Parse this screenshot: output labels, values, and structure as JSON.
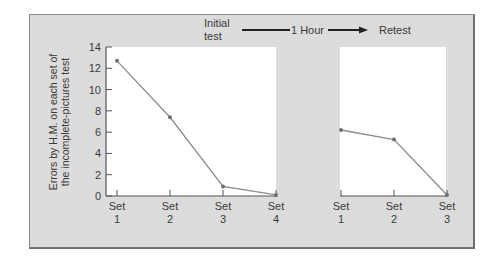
{
  "header": {
    "initial_line1": "Initial",
    "initial_line2": "test",
    "interval": "1 Hour",
    "retest": "Retest"
  },
  "y_axis_label_line1": "Errors by H.M. on each set of",
  "y_axis_label_line2": "the incomplete-pictures test",
  "colors": {
    "panel": "#dcdcdc",
    "plot_bg": "#ffffff",
    "line": "#8c8c8c",
    "marker": "#6e6e6e",
    "axis": "#555555",
    "text": "#3a3a3a"
  },
  "chart_data": [
    {
      "type": "line",
      "title": "Initial test",
      "categories": [
        "Set 1",
        "Set 2",
        "Set 3",
        "Set 4"
      ],
      "series": [
        {
          "name": "Errors by H.M.",
          "values": [
            12.7,
            7.4,
            0.9,
            0.1
          ]
        }
      ],
      "xlabel": "",
      "ylabel": "Errors by H.M. on each set of the incomplete-pictures test",
      "ylim": [
        0,
        14
      ],
      "yticks": [
        0,
        2,
        4,
        6,
        8,
        10,
        12,
        14
      ],
      "grid": false
    },
    {
      "type": "line",
      "title": "Retest (after 1 Hour)",
      "categories": [
        "Set 1",
        "Set 2",
        "Set 3"
      ],
      "series": [
        {
          "name": "Errors by H.M.",
          "values": [
            6.2,
            5.3,
            0.1
          ]
        }
      ],
      "xlabel": "",
      "ylabel": "",
      "ylim": [
        0,
        14
      ],
      "grid": false
    }
  ]
}
